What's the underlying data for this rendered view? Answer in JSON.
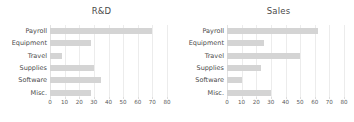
{
  "chart_data": [
    {
      "type": "bar",
      "orientation": "horizontal",
      "title": "R&D",
      "xlabel": "",
      "ylabel": "",
      "categories": [
        "Payroll",
        "Equipment",
        "Travel",
        "Supplies",
        "Software",
        "Misc."
      ],
      "values": [
        70,
        28,
        8,
        30,
        35,
        28
      ],
      "xlim": [
        0,
        80
      ],
      "xticks": [
        0,
        10,
        20,
        30,
        40,
        50,
        60,
        70,
        80
      ],
      "xticklabels": [
        "0",
        "10",
        "20",
        "30",
        "40",
        "50",
        "60",
        "70",
        "80"
      ],
      "grid": true,
      "grid_axis": "x",
      "legend": false,
      "bar_color": "#d4d4d4",
      "grid_color": "#ececec",
      "background": "#ffffff"
    },
    {
      "type": "bar",
      "orientation": "horizontal",
      "title": "Sales",
      "xlabel": "",
      "ylabel": "",
      "categories": [
        "Payroll",
        "Equipment",
        "Travel",
        "Supplies",
        "Software",
        "Misc."
      ],
      "values": [
        62,
        25,
        50,
        23,
        10,
        30
      ],
      "xlim": [
        0,
        80
      ],
      "xticks": [
        0,
        10,
        20,
        30,
        40,
        50,
        60,
        70,
        80
      ],
      "xticklabels": [
        "0",
        "10",
        "20",
        "30",
        "40",
        "50",
        "60",
        "70",
        "80"
      ],
      "grid": true,
      "grid_axis": "x",
      "legend": false,
      "bar_color": "#d4d4d4",
      "grid_color": "#ececec",
      "background": "#ffffff"
    }
  ]
}
